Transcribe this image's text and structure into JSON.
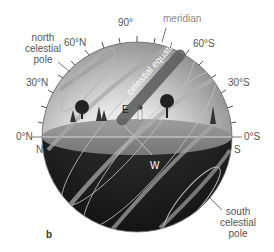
{
  "figure": {
    "panel_label": "b",
    "labels": {
      "zenith": "90°",
      "meridian": "meridian",
      "n60": "60°N",
      "s60": "60°S",
      "n30": "30°N",
      "s30": "30°S",
      "n0": "0°N",
      "s0": "0°S",
      "north": "N",
      "south": "S",
      "east": "E",
      "west": "W",
      "celestial_equator": "celestial equator",
      "ncp": [
        "north",
        "celestial",
        "pole"
      ],
      "scp": [
        "south",
        "celestial",
        "pole"
      ]
    },
    "colors": {
      "sky_top": "#8c8c8c",
      "sky_center": "#f4f4f4",
      "ground_top": "#8e8e8e",
      "below_horizon": "#262626",
      "star_paths": "#a8a8a8",
      "label_text": "#555555"
    }
  }
}
